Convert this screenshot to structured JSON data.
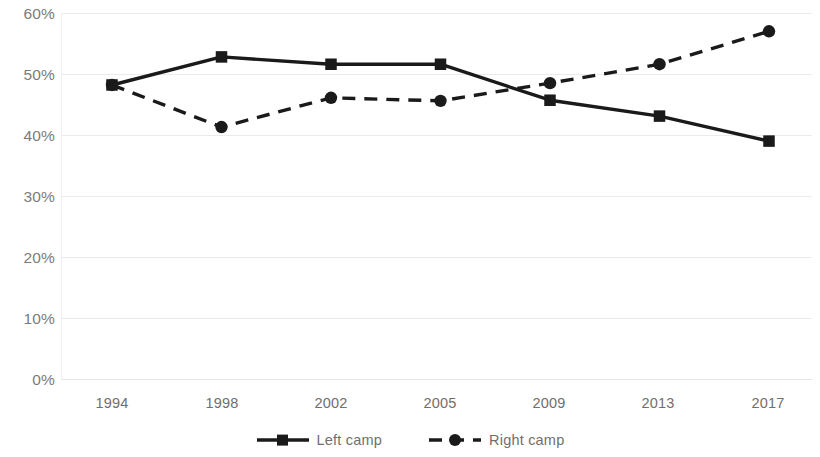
{
  "chart_data": {
    "type": "line",
    "title": "",
    "subtitle": "",
    "xlabel": "",
    "ylabel": "",
    "categories": [
      "1994",
      "1998",
      "2002",
      "2005",
      "2009",
      "2013",
      "2017"
    ],
    "series": [
      {
        "name": "Left camp",
        "style": "solid",
        "marker": "square",
        "color": "#1a1a1a",
        "values": [
          48.2,
          52.8,
          51.6,
          51.6,
          45.7,
          43.1,
          39.0
        ]
      },
      {
        "name": "Right camp",
        "style": "dashed",
        "marker": "circle",
        "color": "#1a1a1a",
        "values": [
          48.2,
          41.3,
          46.1,
          45.6,
          48.5,
          51.6,
          57.0
        ]
      }
    ],
    "ylim": [
      0,
      60
    ],
    "ytick_values": [
      0,
      10,
      20,
      30,
      40,
      50,
      60
    ],
    "ytick_labels": [
      "0%",
      "10%",
      "20%",
      "30%",
      "40%",
      "50%",
      "60%"
    ],
    "grid": true,
    "grid_axis": "y",
    "legend_position": "bottom",
    "axis_label_color": "#6f6f6f",
    "gridline_color": "#eceaea"
  },
  "legend": {
    "entries": [
      {
        "label": "Left camp",
        "icon": "solid-line-square-marker"
      },
      {
        "label": "Right camp",
        "icon": "dashed-line-circle-marker"
      }
    ]
  }
}
